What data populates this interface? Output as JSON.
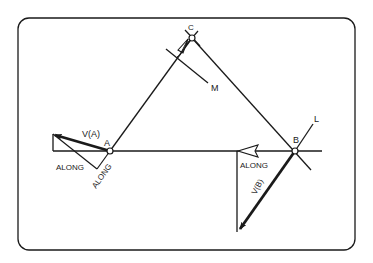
{
  "colors": {
    "background": "#ffffff",
    "ink": "#1a1a1a"
  },
  "diagram": {
    "type": "velocity-analysis",
    "points": {
      "A": {
        "label": "A",
        "x": 110,
        "y": 151
      },
      "B": {
        "label": "B",
        "x": 295,
        "y": 151
      },
      "C": {
        "label": "C",
        "x": 192,
        "y": 38
      }
    },
    "lines": {
      "M": {
        "label": "M"
      },
      "L": {
        "label": "L"
      }
    },
    "vectors": {
      "VA": {
        "label": "V(A)"
      },
      "VB": {
        "label": "V(B)"
      }
    },
    "annotations": {
      "along_a_horizontal": "ALONG",
      "along_a_rotated": "ALONG",
      "along_b": "ALONG"
    }
  }
}
